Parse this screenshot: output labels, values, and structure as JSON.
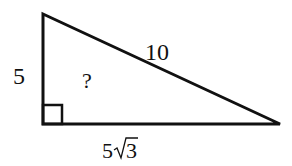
{
  "diagram": {
    "type": "right-triangle",
    "labels": {
      "left_side": "5",
      "hypotenuse": "10",
      "bottom_side_coef": "5",
      "bottom_side_radicand": "3",
      "unknown_angle": "?"
    },
    "colors": {
      "stroke": "#111111",
      "background": "#ffffff"
    }
  }
}
